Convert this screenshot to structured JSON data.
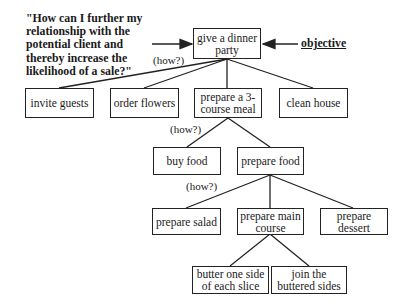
{
  "diagram": {
    "question": "\"How can I further my relationship with the potential client and thereby increase the likelihood of a sale?\"",
    "objective_label": "objective",
    "how_label": "(how?)",
    "root": "give a dinner party",
    "level1": [
      "invite guests",
      "order flowers",
      "prepare a 3-course meal",
      "clean house"
    ],
    "level2": [
      "buy food",
      "prepare food"
    ],
    "level3": [
      "prepare salad",
      "prepare main course",
      "prepare dessert"
    ],
    "level4": [
      "butter one side of each slice",
      "join the buttered sides"
    ]
  }
}
